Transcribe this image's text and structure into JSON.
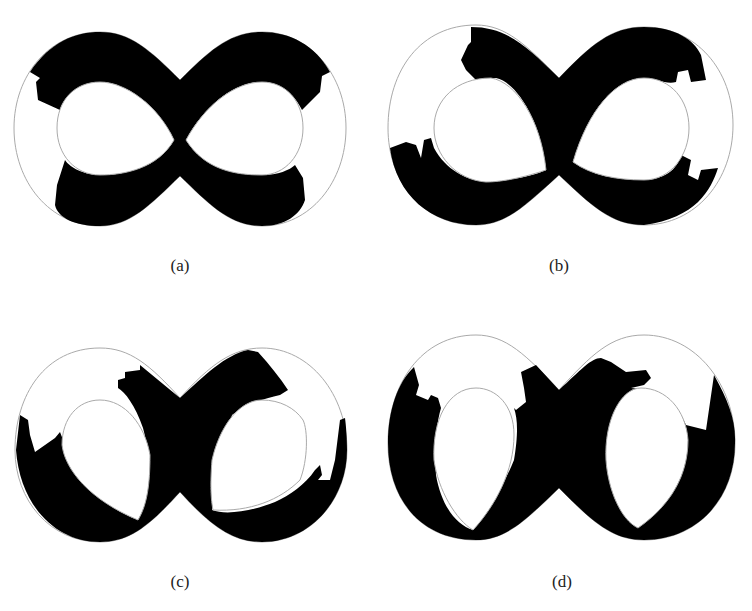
{
  "figure": {
    "panels": [
      {
        "id": "a",
        "label": "(a)"
      },
      {
        "id": "b",
        "label": "(b)"
      },
      {
        "id": "c",
        "label": "(c)"
      },
      {
        "id": "d",
        "label": "(d)"
      }
    ]
  },
  "colors": {
    "fill": "#000000",
    "outline": "#aaaaaa",
    "background": "#ffffff"
  }
}
